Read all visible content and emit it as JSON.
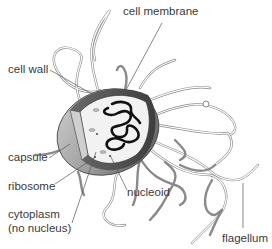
{
  "labels": {
    "cell_membrane": "cell membrane",
    "cell_wall": "cell wall",
    "capsule": "capsule",
    "ribosome": "ribosome",
    "cytoplasm_line1": "cytoplasm",
    "cytoplasm_line2": "(no nucleus)",
    "nucleoid": "nucleoid",
    "flagellum": "flagellum"
  },
  "colors": {
    "capsule_dark": "#5a5a5a",
    "capsule_light": "#bdbdbd",
    "cytoplasm": "#f2f2f2",
    "nucleoid": "#111111",
    "flagella": "#8a8a8a",
    "label_text": "#3a3a3a"
  }
}
